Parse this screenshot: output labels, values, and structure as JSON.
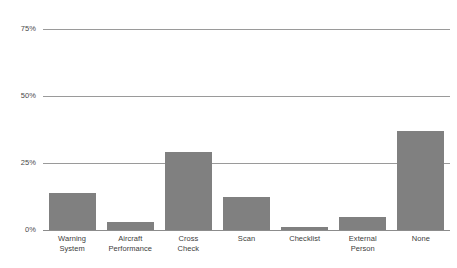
{
  "chart_data": {
    "type": "bar",
    "title": "",
    "subtitle": "",
    "xlabel": "",
    "ylabel": "",
    "categories": [
      "Warning\nSystem",
      "Aircraft\nPerformance",
      "Cross\nCheck",
      "Scan",
      "Checklist",
      "External\nPerson",
      "None"
    ],
    "values": [
      13.8,
      3.0,
      29.0,
      12.3,
      1.0,
      4.9,
      37.0
    ],
    "ylim": [
      0,
      80
    ],
    "yticks": [
      0,
      25,
      50,
      75
    ],
    "ytick_labels": [
      "0%",
      "25%",
      "50%",
      "75%"
    ],
    "grid": true,
    "legend": false,
    "bar_color": "#808080",
    "gridline_color": "#9a9a9a",
    "axis_color": "#8c8c8c",
    "background_color": "#ffffff"
  }
}
